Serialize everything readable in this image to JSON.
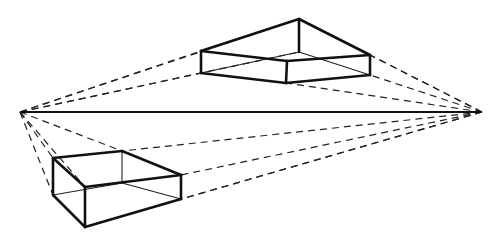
{
  "diagram": {
    "title": "Two-point perspective: boxes above and below the horizon",
    "canvas": {
      "width": 496,
      "height": 242,
      "background": "#ffffff"
    },
    "colors": {
      "line": "#111111"
    },
    "horizon": {
      "y": 112,
      "x1": 20,
      "x2": 482
    },
    "vanishing_points": [
      {
        "name": "left-vp",
        "x": 20,
        "y": 112
      },
      {
        "name": "right-vp",
        "x": 482,
        "y": 112
      }
    ],
    "boxes": [
      {
        "name": "upper-box",
        "position": "above horizon",
        "heavy_edges": [
          [
            201,
            51,
            299,
            19
          ],
          [
            299,
            19,
            370,
            55
          ],
          [
            201,
            51,
            287,
            61
          ],
          [
            287,
            61,
            370,
            55
          ],
          [
            201,
            51,
            201,
            73
          ],
          [
            370,
            55,
            370,
            75
          ],
          [
            299,
            19,
            299,
            52
          ],
          [
            201,
            73,
            286,
            83
          ],
          [
            286,
            83,
            370,
            75
          ],
          [
            287,
            61,
            286,
            83
          ]
        ],
        "thin_edges": [
          [
            201,
            73,
            299,
            52
          ],
          [
            299,
            52,
            370,
            75
          ]
        ]
      },
      {
        "name": "lower-box",
        "position": "below horizon",
        "heavy_edges": [
          [
            53,
            158,
            122,
            151
          ],
          [
            122,
            151,
            181,
            175
          ],
          [
            53,
            158,
            85,
            187
          ],
          [
            85,
            187,
            181,
            175
          ],
          [
            53,
            158,
            53,
            195
          ],
          [
            85,
            187,
            85,
            227
          ],
          [
            181,
            175,
            181,
            199
          ],
          [
            53,
            195,
            85,
            227
          ],
          [
            85,
            227,
            181,
            199
          ]
        ],
        "thin_edges": [
          [
            122,
            151,
            122,
            183
          ],
          [
            53,
            195,
            122,
            183
          ],
          [
            122,
            183,
            181,
            199
          ]
        ]
      }
    ],
    "construction_lines": [
      [
        20,
        112,
        201,
        51
      ],
      [
        20,
        112,
        201,
        73
      ],
      [
        20,
        112,
        299,
        19
      ],
      [
        20,
        112,
        299,
        52
      ],
      [
        482,
        112,
        370,
        55
      ],
      [
        482,
        112,
        370,
        75
      ],
      [
        482,
        112,
        299,
        19
      ],
      [
        482,
        112,
        286,
        83
      ],
      [
        20,
        112,
        53,
        158
      ],
      [
        20,
        112,
        53,
        195
      ],
      [
        20,
        112,
        122,
        151
      ],
      [
        20,
        112,
        85,
        187
      ],
      [
        482,
        112,
        122,
        151
      ],
      [
        482,
        112,
        181,
        175
      ],
      [
        482,
        112,
        181,
        199
      ],
      [
        482,
        112,
        85,
        227
      ]
    ]
  }
}
